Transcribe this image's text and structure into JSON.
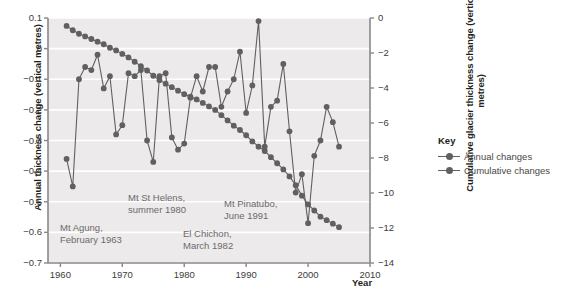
{
  "chart_data": {
    "type": "line",
    "title": "",
    "xlabel": "Year",
    "ylabel_left": "Annual thickness change (vertical metres)",
    "ylabel_right": "Cumulative glacier thickness change (vertical metres)",
    "xlim": [
      1958,
      2010
    ],
    "ylim_left": [
      -0.7,
      0.1
    ],
    "ylim_right": [
      -14,
      0
    ],
    "xticks": [
      1960,
      1970,
      1980,
      1990,
      2000,
      2010
    ],
    "xtick_labels": [
      "1960",
      "1970",
      "1980",
      "1990",
      "2000",
      "2010"
    ],
    "yticks_left": [
      0.1,
      0,
      -0.1,
      -0.2,
      -0.3,
      -0.4,
      -0.5,
      -0.6,
      -0.7
    ],
    "ytick_labels_left": [
      "0.1",
      "0",
      "−0.1",
      "−0.2",
      "−0.3",
      "−0.4",
      "−0.5",
      "−0.6",
      "−0.7"
    ],
    "yticks_right": [
      0,
      -2,
      -4,
      -6,
      -8,
      -10,
      -12,
      -14
    ],
    "ytick_labels_right": [
      "0",
      "−2",
      "−4",
      "−6",
      "−8",
      "−10",
      "−12",
      "−14"
    ],
    "grid": "horizontal-white",
    "legend_position": "right",
    "plot_background": "#eceaea",
    "series": [
      {
        "name": "Annual changes",
        "axis": "left",
        "color": "#616060",
        "x": [
          1961,
          1962,
          1963,
          1964,
          1965,
          1966,
          1967,
          1968,
          1969,
          1970,
          1971,
          1972,
          1973,
          1974,
          1975,
          1976,
          1977,
          1978,
          1979,
          1980,
          1981,
          1982,
          1983,
          1984,
          1985,
          1986,
          1987,
          1988,
          1989,
          1990,
          1991,
          1992,
          1993,
          1994,
          1995,
          1996,
          1997,
          1998,
          1999,
          2000,
          2001,
          2002,
          2003,
          2004,
          2005
        ],
        "values": [
          -0.36,
          -0.45,
          -0.1,
          -0.06,
          -0.07,
          -0.02,
          -0.13,
          -0.09,
          -0.28,
          -0.25,
          -0.08,
          -0.09,
          -0.07,
          -0.3,
          -0.37,
          -0.09,
          -0.08,
          -0.29,
          -0.33,
          -0.31,
          -0.16,
          -0.09,
          -0.14,
          -0.06,
          -0.06,
          -0.19,
          -0.14,
          -0.1,
          -0.01,
          -0.21,
          -0.12,
          0.09,
          -0.32,
          -0.19,
          -0.17,
          -0.05,
          -0.27,
          -0.47,
          -0.41,
          -0.57,
          -0.35,
          -0.3,
          -0.19,
          -0.24,
          -0.32
        ]
      },
      {
        "name": "Cumulative changes",
        "axis": "right",
        "color": "#616060",
        "x": [
          1961,
          1962,
          1963,
          1964,
          1965,
          1966,
          1967,
          1968,
          1969,
          1970,
          1971,
          1972,
          1973,
          1974,
          1975,
          1976,
          1977,
          1978,
          1979,
          1980,
          1981,
          1982,
          1983,
          1984,
          1985,
          1986,
          1987,
          1988,
          1989,
          1990,
          1991,
          1992,
          1993,
          1994,
          1995,
          1996,
          1997,
          1998,
          1999,
          2000,
          2001,
          2002,
          2003,
          2004,
          2005
        ],
        "values": [
          -0.45,
          -0.7,
          -0.9,
          -1.05,
          -1.2,
          -1.35,
          -1.5,
          -1.7,
          -1.85,
          -2.05,
          -2.25,
          -2.5,
          -2.75,
          -3.0,
          -3.3,
          -3.55,
          -3.75,
          -3.95,
          -4.15,
          -4.35,
          -4.5,
          -4.65,
          -4.85,
          -5.05,
          -5.25,
          -5.55,
          -5.85,
          -6.15,
          -6.4,
          -6.7,
          -7.05,
          -7.35,
          -7.6,
          -7.95,
          -8.3,
          -8.65,
          -9.05,
          -9.55,
          -10.15,
          -10.65,
          -11.0,
          -11.35,
          -11.55,
          -11.75,
          -11.95
        ]
      }
    ],
    "annotations": [
      {
        "id": "mt-agung",
        "line1": "Mt Agung,",
        "line2": "February 1963",
        "x_px": 60,
        "y_px": 222
      },
      {
        "id": "mt-st-helens",
        "line1": "Mt St Helens,",
        "line2": "summer 1980",
        "x_px": 128,
        "y_px": 192
      },
      {
        "id": "el-chichon",
        "line1": "El Chichon,",
        "line2": "March 1982",
        "x_px": 183,
        "y_px": 228
      },
      {
        "id": "mt-pinatubo",
        "line1": "Mt Pinatubo,",
        "line2": "June 1991",
        "x_px": 224,
        "y_px": 198
      }
    ]
  },
  "legend": {
    "title": "Key",
    "items": [
      {
        "label": "Annual changes",
        "color": "#616060"
      },
      {
        "label": "Cumulative changes",
        "color": "#616060"
      }
    ]
  }
}
